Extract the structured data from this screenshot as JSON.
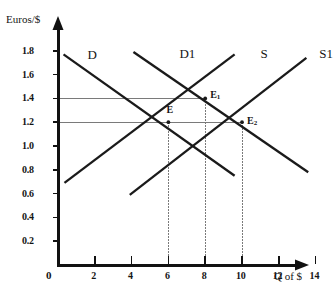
{
  "chart_data": {
    "type": "line",
    "title": "",
    "xlabel": "Q of $",
    "ylabel": "Euros/$",
    "xlim": [
      0,
      15.2
    ],
    "ylim": [
      0,
      1.95
    ],
    "grid": false,
    "legend_position": "inline-curve-labels",
    "x_ticks": [
      "2",
      "4",
      "6",
      "8",
      "10",
      "12",
      "14"
    ],
    "x_tick_values": [
      2,
      4,
      6,
      8,
      10,
      12,
      14
    ],
    "y_ticks": [
      "0.2",
      "0.4",
      "0.6",
      "0.8",
      "1.0",
      "1.2",
      "1.4",
      "1.6",
      "1.8"
    ],
    "y_tick_values": [
      0.2,
      0.4,
      0.6,
      0.8,
      1.0,
      1.2,
      1.4,
      1.6,
      1.8
    ],
    "origin_label": "0",
    "series": [
      {
        "name": "D",
        "label": "D",
        "role": "demand",
        "color": "#1a1a1a",
        "points": [
          [
            0.3,
            1.77
          ],
          [
            9.6,
            0.75
          ]
        ],
        "label_x": 1.6,
        "label_y": 1.82
      },
      {
        "name": "D1",
        "label": "D1",
        "role": "demand-shifted",
        "color": "#1a1a1a",
        "points": [
          [
            4.1,
            1.79
          ],
          [
            13.6,
            0.78
          ]
        ],
        "label_x": 6.6,
        "label_y": 1.83
      },
      {
        "name": "S",
        "label": "S",
        "role": "supply",
        "color": "#1a1a1a",
        "points": [
          [
            0.35,
            0.69
          ],
          [
            9.6,
            1.77
          ]
        ],
        "label_x": 11.0,
        "label_y": 1.83
      },
      {
        "name": "S1",
        "label": "S1",
        "role": "supply-shifted",
        "color": "#1a1a1a",
        "points": [
          [
            3.9,
            0.59
          ],
          [
            13.5,
            1.74
          ]
        ],
        "label_x": 14.2,
        "label_y": 1.83
      }
    ],
    "annotations": [
      {
        "name": "E",
        "label": "E",
        "sub": "",
        "x": 6,
        "y": 1.2,
        "label_dx": -2,
        "label_dy": -11
      },
      {
        "name": "E1",
        "label": "E",
        "sub": "1",
        "x": 8,
        "y": 1.4,
        "label_dx": 5,
        "label_dy": -2
      },
      {
        "name": "E2",
        "label": "E",
        "sub": "2",
        "x": 10,
        "y": 1.2,
        "label_dx": 5,
        "label_dy": 0
      }
    ],
    "guide_lines": {
      "horizontal": [
        {
          "y": 1.4,
          "from_x": 0,
          "to_x": 8
        },
        {
          "y": 1.2,
          "from_x": 0,
          "to_x": 10
        }
      ],
      "vertical": [
        {
          "x": 6,
          "from_y": 1.2,
          "to_y": 0
        },
        {
          "x": 8,
          "from_y": 1.4,
          "to_y": 0
        },
        {
          "x": 10,
          "from_y": 1.2,
          "to_y": 0
        }
      ]
    },
    "colors": {
      "axis": "#111111",
      "curve": "#1a1a1a",
      "guide": "#7a7a7a",
      "text": "#141414",
      "background": "#ffffff"
    }
  },
  "figure": {
    "y_axis_title": "Euros/$",
    "x_axis_title": "Q of $",
    "caption_fragment": ""
  }
}
